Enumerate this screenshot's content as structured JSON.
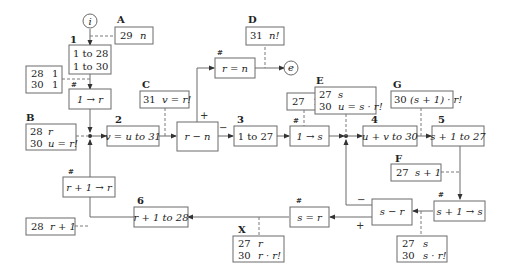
{
  "diagram": {
    "terminals": {
      "start": "i",
      "end": "e"
    },
    "steps": {
      "s1": {
        "num": "1",
        "line1": "1 to 28",
        "line2": "1 to 30"
      },
      "s1r": {
        "mark": "#",
        "text": "1 → r"
      },
      "s2": {
        "num": "2",
        "text": "v = u to 31"
      },
      "cmp_rn": {
        "text": "r − n",
        "plus": "+",
        "minus": "−"
      },
      "s3": {
        "num": "3",
        "text": "1 to 27"
      },
      "req": {
        "mark": "#",
        "text": "r = n"
      },
      "s1s": {
        "mark": "#",
        "text": "1 → s"
      },
      "s4": {
        "num": "4",
        "text": "u + v to 30"
      },
      "s5": {
        "num": "5",
        "text": "s + 1 to 27"
      },
      "sinc": {
        "mark": "#",
        "text": "s + 1 → s"
      },
      "cmp_sr": {
        "text": "s − r",
        "minus": "−",
        "plus": "+"
      },
      "seq": {
        "mark": "#",
        "text": "s = r"
      },
      "s6": {
        "num": "6",
        "text": "r + 1 to 28"
      },
      "rinc": {
        "mark": "#",
        "text": "r + 1 → r"
      }
    },
    "notes": {
      "A": {
        "label": "A",
        "line1_a": "29",
        "line1_b": "n"
      },
      "init": {
        "line1_a": "28",
        "line1_b": "1",
        "line2_a": "30",
        "line2_b": "1"
      },
      "B": {
        "label": "B",
        "line1_a": "28",
        "line1_b": "r",
        "line2_a": "30",
        "line2_b": "u = r!"
      },
      "C": {
        "label": "C",
        "line1_a": "31",
        "line1_b": "v = r!"
      },
      "D": {
        "label": "D",
        "line1_a": "31",
        "line1_b": "n!"
      },
      "K": {
        "line1_a": "27",
        "line1_b": "1"
      },
      "E": {
        "label": "E",
        "line1_a": "27",
        "line1_b": "s",
        "line2_a": "30",
        "line2_b": "u = s · r!"
      },
      "G": {
        "label": "G",
        "line1_a": "30",
        "line1_b": "(s + 1) · r!"
      },
      "F": {
        "label": "F",
        "line1_a": "27",
        "line1_b": "s + 1"
      },
      "H": {
        "line1_a": "27",
        "line1_b": "s",
        "line2_a": "30",
        "line2_b": "s · r!"
      },
      "X": {
        "label": "X",
        "line1_a": "27",
        "line1_b": "r",
        "line2_a": "30",
        "line2_b": "r · r!"
      },
      "R": {
        "line1_a": "28",
        "line1_b": "r + 1"
      }
    }
  }
}
